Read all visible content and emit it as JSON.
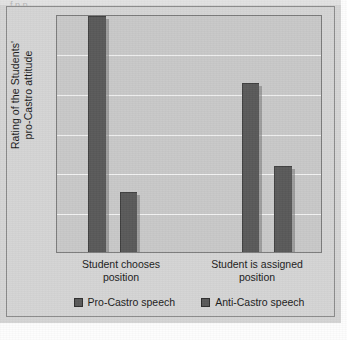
{
  "figure": {
    "background_color": "#d4d4d4",
    "plot_background_color": "#c8c8c8",
    "bar_color": "#595959",
    "gridline_color": "#f2f2f2",
    "frame_color": "#8a8a8a"
  },
  "artifact_text": "f   p    p",
  "chart_data": {
    "type": "bar",
    "title": "",
    "subtitle": "",
    "xlabel": "",
    "ylabel": "Rating of the Students' pro-Castro attitude",
    "ylabel_lines": [
      "Rating of the Students'",
      "pro-Castro attitude"
    ],
    "categories": [
      "Student chooses position",
      "Student is assigned position"
    ],
    "category_lines": [
      [
        "Student chooses",
        "position"
      ],
      [
        "Student is assigned",
        "position"
      ]
    ],
    "series": [
      {
        "name": "Pro-Castro speech",
        "color": "#595959",
        "values": [
          6.0,
          4.3
        ]
      },
      {
        "name": "Anti-Castro speech",
        "color": "#595959",
        "values": [
          1.55,
          2.2
        ]
      }
    ],
    "ylim": [
      0,
      6
    ],
    "yticks": [
      0,
      1,
      2,
      3,
      4,
      5,
      6
    ],
    "ytick_labels": [],
    "grid": true,
    "grid_axis": "y",
    "gridline_count": 5,
    "legend": {
      "position": "bottom",
      "entries": [
        {
          "label": "Pro-Castro speech",
          "color": "#595959"
        },
        {
          "label": "Anti-Castro speech",
          "color": "#595959"
        }
      ]
    },
    "bar_geometry": {
      "plot_px": {
        "x": 56,
        "y": 15,
        "width": 266,
        "height": 238
      },
      "bars": [
        {
          "series": "Pro-Castro speech",
          "category": "Student chooses position",
          "left_px": 31,
          "width_px": 18,
          "height_pct": 100.0
        },
        {
          "series": "Anti-Castro speech",
          "category": "Student chooses position",
          "left_px": 63,
          "width_px": 17,
          "height_pct": 25.6
        },
        {
          "series": "Pro-Castro speech",
          "category": "Student is assigned position",
          "left_px": 185,
          "width_px": 17,
          "height_pct": 71.8
        },
        {
          "series": "Anti-Castro speech",
          "category": "Student is assigned position",
          "left_px": 217,
          "width_px": 18,
          "height_pct": 36.6
        }
      ]
    }
  }
}
